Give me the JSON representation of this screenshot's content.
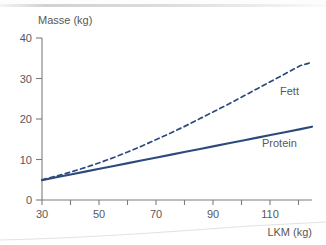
{
  "chart_data": {
    "type": "line",
    "title": "",
    "subtitle": "",
    "xlabel": "LKM (kg)",
    "ylabel": "Masse (kg)",
    "xlim": [
      30,
      124
    ],
    "ylim": [
      0,
      40
    ],
    "grid": false,
    "legend_position": "inline-right",
    "x_ticks": [
      30,
      50,
      70,
      90,
      110
    ],
    "x_tick_labels": [
      "30",
      "50",
      "70",
      "90",
      "110"
    ],
    "x_minor_ticks": [
      40,
      60,
      80,
      100,
      120
    ],
    "y_ticks": [
      0,
      10,
      20,
      30,
      40
    ],
    "y_tick_labels": [
      "0",
      "10",
      "20",
      "30",
      "40"
    ],
    "series": [
      {
        "name": "Fett",
        "style": "dashed",
        "color": "#2d4a7c",
        "x": [
          30,
          35,
          40,
          45,
          50,
          55,
          60,
          65,
          70,
          75,
          80,
          85,
          90,
          95,
          100,
          105,
          110,
          115,
          120,
          124
        ],
        "values": [
          5.0,
          5.9,
          6.9,
          8.0,
          9.2,
          10.5,
          11.9,
          13.4,
          15.0,
          16.6,
          18.3,
          20.1,
          21.9,
          23.7,
          25.6,
          27.5,
          29.4,
          31.3,
          33.2,
          34.0
        ]
      },
      {
        "name": "Protein",
        "style": "solid",
        "color": "#2d4a7c",
        "x": [
          30,
          35,
          40,
          45,
          50,
          55,
          60,
          65,
          70,
          75,
          80,
          85,
          90,
          95,
          100,
          105,
          110,
          115,
          120,
          124
        ],
        "values": [
          4.9,
          5.6,
          6.3,
          7.0,
          7.7,
          8.4,
          9.1,
          9.8,
          10.5,
          11.2,
          11.9,
          12.6,
          13.3,
          14.0,
          14.7,
          15.4,
          16.1,
          16.8,
          17.5,
          18.1
        ]
      }
    ],
    "annotations": [
      {
        "text": "Fett",
        "x": 112,
        "y": 27.5
      },
      {
        "text": "Protein",
        "x": 105,
        "y": 14.5
      }
    ],
    "colors": {
      "line": "#2d4a7c",
      "axis": "#7d7d80",
      "text": "#58585a",
      "background": "#ffffff"
    }
  }
}
